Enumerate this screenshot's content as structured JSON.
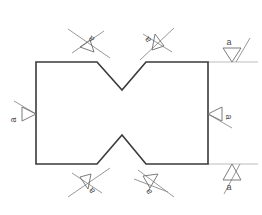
{
  "drawing": {
    "title": "Surface Finish Annotated Part",
    "canvas": {
      "width": 262,
      "height": 215
    },
    "background_color": "#ffffff",
    "outline_color": "#3a3a3a",
    "symbol_color": "#6e6e6e",
    "extension_line_color": "#bcbcbc",
    "label_color": "#4a4a4a",
    "part": {
      "name": "notched-rectangle",
      "points": "36,62 97,62 122,90 146,62 208,62 208,164 146,164 122,135 97,164 36,164",
      "description": "Rectangle with V notch cut into the top edge and a V notch cut into the bottom edge"
    },
    "extension_lines": [
      {
        "name": "top-right-extension",
        "d": "M208,62 L258,62"
      },
      {
        "name": "bottom-right-extension",
        "d": "M208,164 L258,164"
      }
    ],
    "annotations": [
      {
        "id": "top-left-notch-finish",
        "name": "surface-finish-symbol-top-left-notch",
        "label": "a",
        "label_x": 93,
        "label_y": 37,
        "label_rotation": -140,
        "tri": "M80,47 L90,40 L94,52 Z",
        "leader": "M68,29 L110,58",
        "tick": "M72,53 L104,31"
      },
      {
        "id": "top-right-notch-finish",
        "name": "surface-finish-symbol-top-right-notch",
        "label": "a",
        "label_x": 150,
        "label_y": 38,
        "label_rotation": -128,
        "tri": "M155,34 L164,46 L152,50 Z",
        "leader": "M174,28 L140,60",
        "tick": "M143,34 L172,52"
      },
      {
        "id": "right-top-edge-finish",
        "name": "surface-finish-symbol-top-right-edge",
        "label": "a",
        "label_x": 229,
        "label_y": 45,
        "label_rotation": 0,
        "tri": "M223,48 L241,48 L232,62 Z",
        "leader": "M236,62 L250,38",
        "tick": ""
      },
      {
        "id": "left-edge-finish",
        "name": "surface-finish-symbol-left-edge",
        "label": "a",
        "label_x": 16,
        "label_y": 120,
        "label_rotation": -90,
        "tri": "M22,107 L36,114 L22,121 Z",
        "leader": "M36,114 L14,101",
        "tick": ""
      },
      {
        "id": "right-edge-finish",
        "name": "surface-finish-symbol-right-edge",
        "label": "a",
        "label_x": 226,
        "label_y": 117,
        "label_rotation": 90,
        "tri": "M222,107 L208,114 L222,121 Z",
        "leader": "M208,114 L232,128",
        "tick": ""
      },
      {
        "id": "bottom-left-notch-finish",
        "name": "surface-finish-symbol-bottom-left-notch",
        "label": "a",
        "label_x": 94,
        "label_y": 189,
        "label_rotation": -130,
        "tri": "M80,177 L91,174 L88,189 Z",
        "leader": "M68,197 L110,168",
        "tick": "M72,173 L102,193"
      },
      {
        "id": "bottom-right-notch-finish",
        "name": "surface-finish-symbol-bottom-right-notch",
        "label": "a",
        "label_x": 151,
        "label_y": 190,
        "label_rotation": -128,
        "tri": "M143,176 L158,174 L150,188 Z",
        "leader": "M174,197 L138,170",
        "tick": "M134,179 L168,192"
      },
      {
        "id": "right-bottom-edge-finish",
        "name": "surface-finish-symbol-bottom-right-edge",
        "label": "a",
        "label_x": 229,
        "label_y": 190,
        "label_rotation": 0,
        "tri": "M223,180 L241,180 L232,164 Z",
        "leader": "M224,194 L240,164",
        "tick": ""
      }
    ]
  }
}
